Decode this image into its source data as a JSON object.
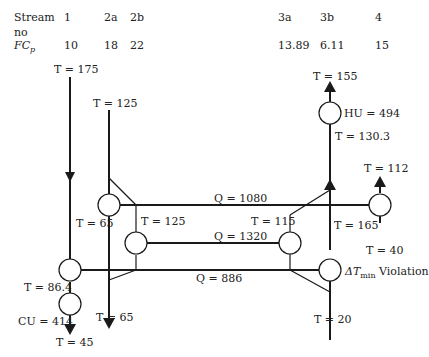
{
  "header": {
    "stream_label": "Stream",
    "stream_label_2": "no",
    "fcp_label_main": "FC",
    "fcp_label_sub": "p",
    "streams": [
      {
        "id": "1",
        "fcp": "10"
      },
      {
        "id": "2a",
        "fcp": "18"
      },
      {
        "id": "2b",
        "fcp": "22"
      },
      {
        "id": "3a",
        "fcp": "13.89"
      },
      {
        "id": "3b",
        "fcp": "6.11"
      },
      {
        "id": "4",
        "fcp": "15"
      }
    ]
  },
  "labels": {
    "t175": "T = 175",
    "t125_top": "T = 125",
    "t65_left": "T = 65",
    "t125_mid": "T = 125",
    "t864": "T = 86.4",
    "cu": "CU = 414",
    "t45": "T = 45",
    "t65_bottom": "T = 65",
    "q1080": "Q = 1080",
    "q1320": "Q = 1320",
    "q886": "Q = 886",
    "t155": "T = 155",
    "hu": "HU = 494",
    "t1303": "T = 130.3",
    "t112": "T = 112",
    "t115": "T = 115",
    "t165": "T = 165",
    "t40": "T = 40",
    "t20": "T = 20",
    "violation_delta": "ΔT",
    "violation_sub": "min",
    "violation_text": " Violation"
  },
  "colors": {
    "line": "#1a1a1a",
    "text": "#222222"
  }
}
